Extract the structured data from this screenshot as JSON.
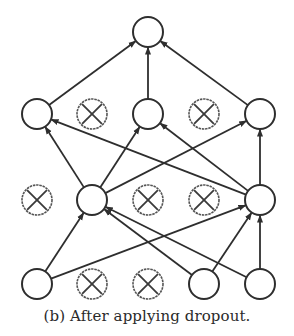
{
  "caption": "(b) After applying dropout.",
  "colors": {
    "stroke": "#2e2e2e",
    "background": "#ffffff"
  },
  "node_radius": 15,
  "nodes": [
    {
      "id": "out",
      "x": 148,
      "y": 32,
      "dropped": false,
      "layer": "output"
    },
    {
      "id": "h2_1",
      "x": 37,
      "y": 114,
      "dropped": false,
      "layer": "hidden2"
    },
    {
      "id": "h2_2",
      "x": 92,
      "y": 114,
      "dropped": true,
      "layer": "hidden2"
    },
    {
      "id": "h2_3",
      "x": 148,
      "y": 114,
      "dropped": false,
      "layer": "hidden2"
    },
    {
      "id": "h2_4",
      "x": 204,
      "y": 114,
      "dropped": true,
      "layer": "hidden2"
    },
    {
      "id": "h2_5",
      "x": 260,
      "y": 114,
      "dropped": false,
      "layer": "hidden2"
    },
    {
      "id": "h1_1",
      "x": 37,
      "y": 200,
      "dropped": true,
      "layer": "hidden1"
    },
    {
      "id": "h1_2",
      "x": 92,
      "y": 200,
      "dropped": false,
      "layer": "hidden1"
    },
    {
      "id": "h1_3",
      "x": 148,
      "y": 200,
      "dropped": true,
      "layer": "hidden1"
    },
    {
      "id": "h1_4",
      "x": 204,
      "y": 200,
      "dropped": true,
      "layer": "hidden1"
    },
    {
      "id": "h1_5",
      "x": 260,
      "y": 200,
      "dropped": false,
      "layer": "hidden1"
    },
    {
      "id": "in_1",
      "x": 37,
      "y": 284,
      "dropped": false,
      "layer": "input"
    },
    {
      "id": "in_2",
      "x": 92,
      "y": 284,
      "dropped": true,
      "layer": "input"
    },
    {
      "id": "in_3",
      "x": 148,
      "y": 284,
      "dropped": true,
      "layer": "input"
    },
    {
      "id": "in_4",
      "x": 204,
      "y": 284,
      "dropped": false,
      "layer": "input"
    },
    {
      "id": "in_5",
      "x": 260,
      "y": 284,
      "dropped": false,
      "layer": "input"
    }
  ],
  "edges": [
    [
      "h2_1",
      "out"
    ],
    [
      "h2_3",
      "out"
    ],
    [
      "h2_5",
      "out"
    ],
    [
      "h1_2",
      "h2_1"
    ],
    [
      "h1_2",
      "h2_3"
    ],
    [
      "h1_2",
      "h2_5"
    ],
    [
      "h1_5",
      "h2_1"
    ],
    [
      "h1_5",
      "h2_3"
    ],
    [
      "h1_5",
      "h2_5"
    ],
    [
      "in_1",
      "h1_2"
    ],
    [
      "in_1",
      "h1_5"
    ],
    [
      "in_4",
      "h1_2"
    ],
    [
      "in_4",
      "h1_5"
    ],
    [
      "in_5",
      "h1_2"
    ],
    [
      "in_5",
      "h1_5"
    ]
  ]
}
